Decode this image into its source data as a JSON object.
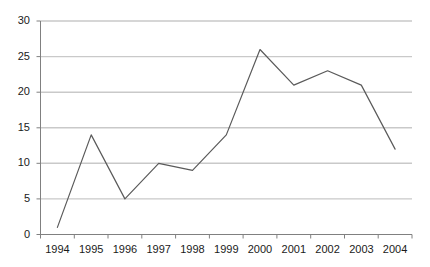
{
  "chart_data": {
    "type": "line",
    "title": "",
    "subtitle": "",
    "xlabel": "",
    "ylabel": "",
    "categories": [
      "1994",
      "1995",
      "1996",
      "1997",
      "1998",
      "1999",
      "2000",
      "2001",
      "2002",
      "2003",
      "2004"
    ],
    "values": [
      1,
      14,
      5,
      10,
      9,
      14,
      26,
      21,
      23,
      21,
      12
    ],
    "series": [
      {
        "name": "",
        "values": [
          1,
          14,
          5,
          10,
          9,
          14,
          26,
          21,
          23,
          21,
          12
        ]
      }
    ],
    "ylim": [
      0,
      30
    ],
    "ytick_labels": [
      "0",
      "5",
      "10",
      "15",
      "20",
      "25",
      "30"
    ],
    "ytick_values": [
      0,
      5,
      10,
      15,
      20,
      25,
      30
    ],
    "grid": true,
    "grid_axis": "y",
    "legend": false,
    "legend_position": "none",
    "annotations": [],
    "colors": {
      "line": "#5a5a5a",
      "grid": "#c9c9c9",
      "axis": "#808080",
      "text": "#1a1a1a",
      "background": "#ffffff"
    }
  }
}
